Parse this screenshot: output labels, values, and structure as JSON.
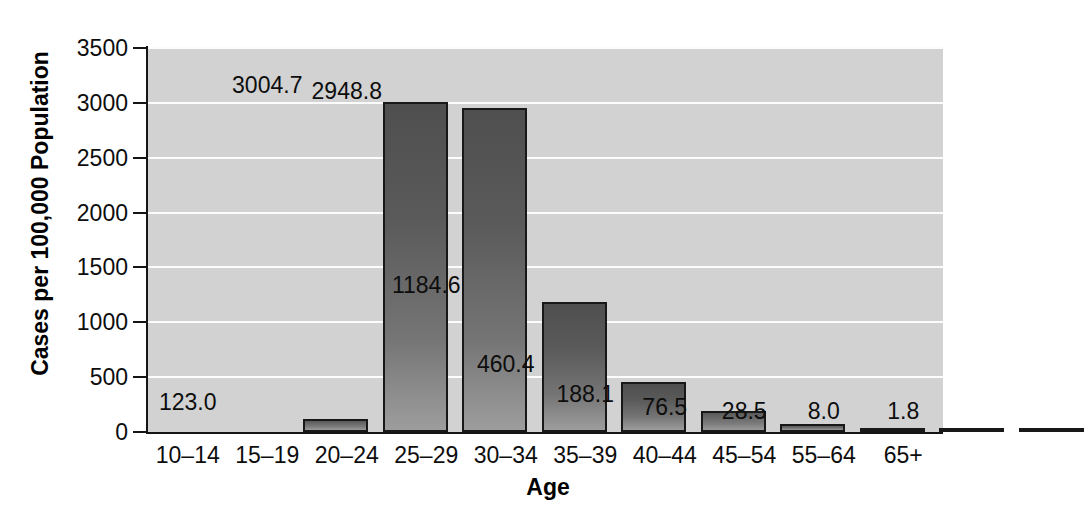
{
  "chart_data": {
    "type": "bar",
    "title": "",
    "xlabel": "Age",
    "ylabel": "Cases per 100,000 Population",
    "categories": [
      "10–14",
      "15–19",
      "20–24",
      "25–29",
      "30–34",
      "35–39",
      "40–44",
      "45–54",
      "55–64",
      "65+"
    ],
    "values": [
      123.0,
      3004.7,
      2948.8,
      1184.6,
      460.4,
      188.1,
      76.5,
      28.5,
      8.0,
      1.8
    ],
    "value_labels": [
      "123.0",
      "3004.7",
      "2948.8",
      "1184.6",
      "460.4",
      "188.1",
      "76.5",
      "28.5",
      "8.0",
      "1.8"
    ],
    "ylim": [
      0,
      3500
    ],
    "yticks": [
      0,
      500,
      1000,
      1500,
      2000,
      2500,
      3000,
      3500
    ],
    "ytick_labels": [
      "0",
      "500",
      "1000",
      "1500",
      "2000",
      "2500",
      "3000",
      "3500"
    ],
    "grid": true,
    "grid_axis": "y",
    "legend": false,
    "legend_position": "none",
    "colors": {
      "plot_background": "#d2d2d2",
      "gridline": "#fcfcfc",
      "bar_top": "#4f4f4f",
      "bar_bottom": "#9d9d9d",
      "bar_outline": "#181818",
      "axis": "#151515",
      "text": "#0d0d0d",
      "figure_background": "#ffffff"
    }
  }
}
